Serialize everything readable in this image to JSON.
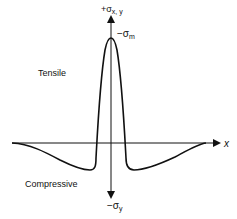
{
  "diagram": {
    "type": "stress-distribution",
    "axes": {
      "x_label": "x",
      "y_top_label": "+σ",
      "y_top_subscript": "x, y",
      "y_bottom_label": "−σ",
      "y_bottom_subscript": "y"
    },
    "annotations": {
      "peak_label": "−σ",
      "peak_subscript": "m",
      "upper_region": "Tensile",
      "lower_region": "Compressive"
    },
    "colors": {
      "line": "#111111",
      "background": "#ffffff"
    }
  }
}
